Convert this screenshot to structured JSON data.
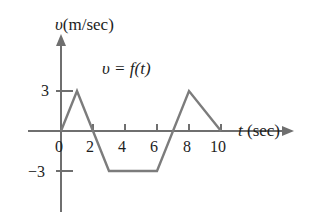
{
  "figure": {
    "kind": "velocity-time-graph",
    "stroke_color": "#7c7c7c",
    "axis_color": "#6f6f6f",
    "text_color": "#1d1d1d",
    "background": "#ffffff"
  },
  "labels": {
    "y_axis_symbol": "υ",
    "y_axis_units": "(m/sec)",
    "x_axis_symbol": "t",
    "x_axis_units": "(sec)",
    "function_label": "υ = f(t)",
    "origin": "0",
    "y_tick_positive": "3",
    "y_tick_negative": "−3"
  },
  "chart_data": {
    "type": "line",
    "title": "",
    "subtitle": "",
    "xlabel": "t (sec)",
    "ylabel": "υ(m/sec)",
    "annotations": [
      "υ = f(t)"
    ],
    "grid": false,
    "legend": "none",
    "xlim": [
      -0.4,
      11.5
    ],
    "ylim": [
      -5.2,
      4.6
    ],
    "xticks": [
      0,
      2,
      4,
      6,
      8,
      10
    ],
    "xtick_labels": [
      "0",
      "2",
      "4",
      "6",
      "8",
      "10"
    ],
    "yticks": [
      3,
      -3
    ],
    "ytick_labels": [
      "3",
      "−3"
    ],
    "series": [
      {
        "name": "v = f(t)",
        "x": [
          0,
          1,
          3,
          6,
          8,
          10
        ],
        "y": [
          0,
          3,
          -3,
          -3,
          3,
          0
        ]
      }
    ],
    "zero_crossings": [
      0,
      2,
      7,
      10
    ]
  }
}
